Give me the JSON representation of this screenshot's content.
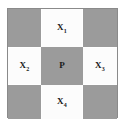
{
  "figure": {
    "type": "cross-pattern-grid",
    "title": "",
    "colors": {
      "shaded_cell": "#9b9b9b",
      "light_cell": "#fcfcfc",
      "frame_border": "#8a8a8a",
      "text": "#1a1a1a",
      "background": "#ffffff"
    },
    "grid": {
      "rows": 3,
      "columns": 3,
      "cells": [
        {
          "position": "top-left",
          "row": 1,
          "col": 1,
          "shaded": true,
          "base": "",
          "sub": ""
        },
        {
          "position": "top-center",
          "row": 1,
          "col": 2,
          "shaded": false,
          "base": "X",
          "sub": "1"
        },
        {
          "position": "top-right",
          "row": 1,
          "col": 3,
          "shaded": true,
          "base": "",
          "sub": ""
        },
        {
          "position": "middle-left",
          "row": 2,
          "col": 1,
          "shaded": false,
          "base": "X",
          "sub": "2"
        },
        {
          "position": "center",
          "row": 2,
          "col": 2,
          "shaded": true,
          "base": "P",
          "sub": ""
        },
        {
          "position": "middle-right",
          "row": 2,
          "col": 3,
          "shaded": false,
          "base": "X",
          "sub": "3"
        },
        {
          "position": "bottom-left",
          "row": 3,
          "col": 1,
          "shaded": true,
          "base": "",
          "sub": ""
        },
        {
          "position": "bottom-center",
          "row": 3,
          "col": 2,
          "shaded": false,
          "base": "X",
          "sub": "4"
        },
        {
          "position": "bottom-right",
          "row": 3,
          "col": 3,
          "shaded": true,
          "base": "",
          "sub": ""
        }
      ]
    }
  }
}
